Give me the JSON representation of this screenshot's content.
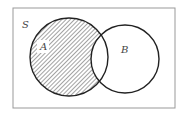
{
  "diagram": {
    "type": "venn",
    "universe_label": "S",
    "sets": [
      {
        "label": "A",
        "shaded": "A minus B"
      },
      {
        "label": "B",
        "shaded": "none"
      }
    ],
    "shaded_region": "A \\ B (A excluding intersection with B)",
    "colors": {
      "stroke": "#222222",
      "border": "#999999",
      "hatch": "#555555",
      "background": "#ffffff"
    }
  }
}
